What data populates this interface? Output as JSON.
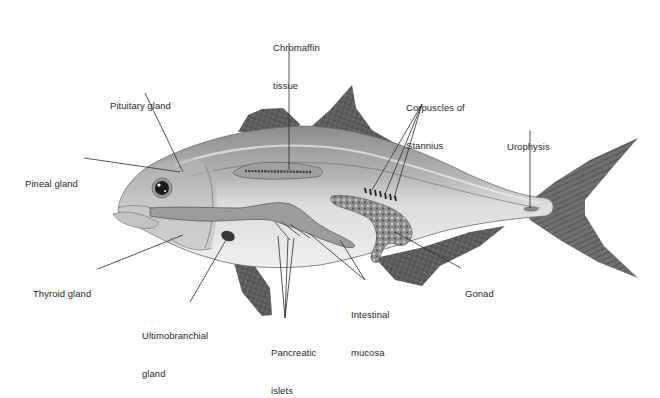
{
  "diagram": {
    "colors": {
      "background": "#ffffff",
      "label_text": "#2a2a2a",
      "leader_line": "#2b2b2b",
      "fin_dark": "#5a5a5a",
      "body_light": "#e6e6e6",
      "body_dorsal": "#9a9a9a"
    },
    "labels": [
      {
        "id": "chromaffin",
        "line1": "Chromaffin",
        "line2": "tissue"
      },
      {
        "id": "pituitary",
        "line1": "Pituitary gland",
        "line2": ""
      },
      {
        "id": "pineal",
        "line1": "Pineal gland",
        "line2": ""
      },
      {
        "id": "corpuscles",
        "line1": "Corpuscles of",
        "line2": "Stannius"
      },
      {
        "id": "urophysis",
        "line1": "Urophysis",
        "line2": ""
      },
      {
        "id": "thyroid",
        "line1": "Thyroid gland",
        "line2": ""
      },
      {
        "id": "ultimobranchial",
        "line1": "Ultimobranchial",
        "line2": "gland"
      },
      {
        "id": "pancreatic",
        "line1": "Pancreatic",
        "line2": "islets"
      },
      {
        "id": "intestinal",
        "line1": "Intestinal",
        "line2": "mucosa"
      },
      {
        "id": "gonad",
        "line1": "Gonad",
        "line2": ""
      }
    ]
  }
}
